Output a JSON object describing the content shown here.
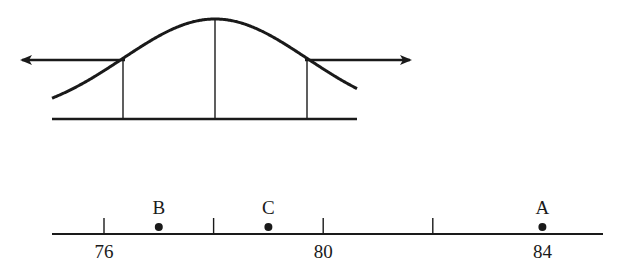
{
  "diagram": {
    "ink_color": "#1a1a1a",
    "background": "#ffffff",
    "distribution": {
      "shape": "normal-curve",
      "peak": {
        "x": 215,
        "y": 19
      },
      "baseline": {
        "y": 119,
        "x_start": 52,
        "x_end": 357
      },
      "sigma_px": 92,
      "vertical_lines": [
        {
          "id": "left-marker",
          "x": 123
        },
        {
          "id": "center-mean",
          "x": 215
        },
        {
          "id": "right-marker",
          "x": 307
        }
      ],
      "arrows": [
        {
          "id": "left-arrow",
          "direction": "left",
          "x_tail": 125,
          "x_head": 22,
          "y": 60
        },
        {
          "id": "right-arrow",
          "direction": "right",
          "x_tail": 305,
          "x_head": 410,
          "y": 60
        }
      ]
    },
    "number_line": {
      "y": 234,
      "x_start": 52,
      "x_end": 603,
      "min_value": 75.05,
      "px_per_unit": 54.8,
      "origin_x": 104,
      "origin_value": 76,
      "ticks": [
        {
          "value": 76,
          "label": "76"
        },
        {
          "value": 78,
          "label": ""
        },
        {
          "value": 80,
          "label": "80"
        },
        {
          "value": 82,
          "label": ""
        },
        {
          "value": 84,
          "label": "84"
        }
      ],
      "points": [
        {
          "label": "B",
          "value": 77
        },
        {
          "label": "C",
          "value": 79
        },
        {
          "label": "A",
          "value": 84
        }
      ]
    }
  }
}
